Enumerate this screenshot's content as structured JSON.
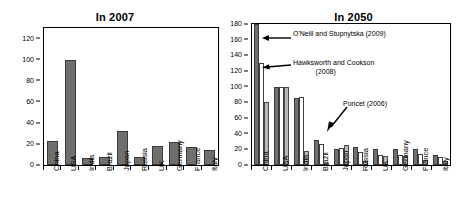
{
  "charts": {
    "left": {
      "title": "In 2007",
      "yticks": [
        0,
        20,
        40,
        60,
        80,
        100,
        120
      ]
    },
    "right": {
      "title": "In 2050",
      "yticks": [
        0,
        20,
        40,
        60,
        80,
        100,
        120,
        140,
        160,
        180
      ],
      "annotations": {
        "a1": "O'Neill and Stupnytska (2009)",
        "a2_line1": "Hawksworth and Cookson",
        "a2_line2": "(2008)",
        "a3": "Poncet (2006)"
      }
    }
  },
  "chart_data": [
    {
      "type": "bar",
      "title": "In 2007",
      "xlabel": "",
      "ylabel": "",
      "ylim": [
        0,
        130
      ],
      "ytick_values": [
        0,
        20,
        40,
        60,
        80,
        100,
        120
      ],
      "grid": false,
      "legend": "none",
      "categories": [
        "China",
        "USA",
        "India",
        "Brazil",
        "Japan",
        "Russia",
        "UK",
        "Germany",
        "France",
        "Italy"
      ],
      "values": [
        23,
        100,
        7,
        8,
        32,
        8,
        18,
        22,
        17,
        14
      ]
    },
    {
      "type": "bar",
      "title": "In 2050",
      "xlabel": "",
      "ylabel": "",
      "ylim": [
        0,
        180
      ],
      "ytick_values": [
        0,
        20,
        40,
        60,
        80,
        100,
        120,
        140,
        160,
        180
      ],
      "grid": false,
      "legend": "annotated-arrows",
      "categories": [
        "China",
        "USA",
        "India",
        "Brazil",
        "Japan",
        "Russia",
        "UK",
        "Germany",
        "France",
        "Italy"
      ],
      "series": [
        {
          "name": "O'Neill and Stupnytska (2009)",
          "style": "dark-gray",
          "values": [
            190,
            100,
            85,
            32,
            20,
            23,
            21,
            21,
            21,
            13
          ]
        },
        {
          "name": "Hawksworth and Cookson (2008)",
          "style": "white",
          "values": [
            130,
            100,
            87,
            27,
            22,
            17,
            13,
            13,
            14,
            10
          ]
        },
        {
          "name": "Poncet (2006)",
          "style": "light-gray",
          "values": [
            81,
            100,
            18,
            3,
            26,
            5,
            11,
            12,
            7,
            5
          ]
        }
      ],
      "notes": "First dark bar for China extends beyond the top of the axis (clipped at 180)."
    }
  ],
  "colors": {
    "dark_bar": "#6f6f6f",
    "white_bar": "#ffffff",
    "light_bar": "#b9b9b9",
    "axis": "#000000",
    "background": "#ffffff"
  }
}
